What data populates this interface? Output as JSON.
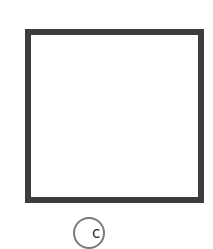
{
  "figure": {
    "shape": "square",
    "stroke_color": "#3c3c3c",
    "fill_color": "#ffffff"
  },
  "option": {
    "label": "c",
    "circle_color": "#7a7a7a"
  }
}
